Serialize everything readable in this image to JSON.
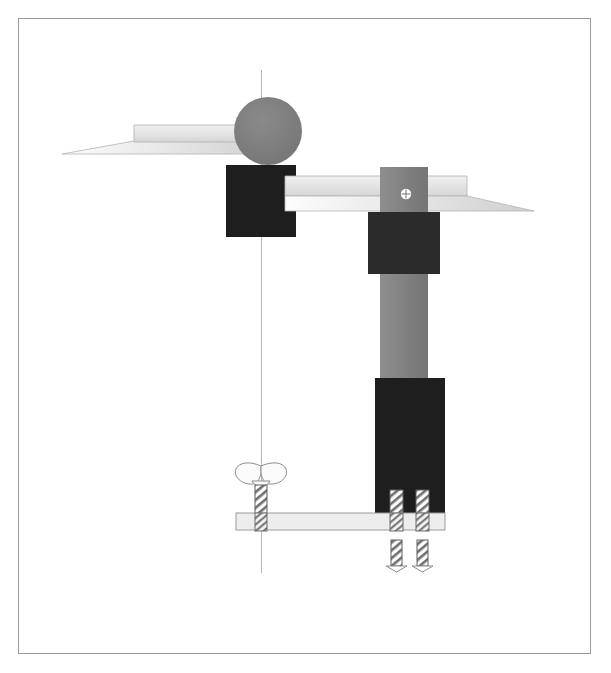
{
  "artwork": {
    "title": "Constructivist Tool Assembly",
    "background_color": "#ffffff",
    "frame": {
      "name": "border-frame",
      "x": 18,
      "y": 18,
      "width": 573,
      "height": 636,
      "stroke_color": "#9a9a9a",
      "stroke_width": 1
    },
    "palette": {
      "near_black": "#1e1e1e",
      "dark_charcoal": "#262626",
      "mid_gray": "#7c7c7c",
      "column_gray": "#858585",
      "light_gray": "#e2e2e2",
      "pale_gray": "#ececec",
      "blade_edge": "#b0b0b0",
      "hatch_gray": "#8a8a8a",
      "outline_gray": "#9a9a9a",
      "white": "#ffffff"
    },
    "axis_line": {
      "name": "vertical-axis-line",
      "x": 261,
      "y_top": 70,
      "y_bottom": 573,
      "color": "#b5b5b5",
      "width": 1
    },
    "shapes": [
      {
        "name": "left-blade-wedge",
        "type": "chisel-blade",
        "fill": "#e8e8e8",
        "stroke": "#a8a8a8",
        "points": "62,153 133,125 262,125 262,153",
        "tip_points": "62,153 133,142 262,142 262,153"
      },
      {
        "name": "left-dark-square",
        "type": "rect",
        "fill": "#1e1e1e",
        "x": 226,
        "y": 165,
        "width": 70,
        "height": 72
      },
      {
        "name": "gray-circle-head",
        "type": "circle",
        "fill": "#7c7c7c",
        "cx": 268,
        "cy": 131,
        "r": 34
      },
      {
        "name": "center-horizontal-blade",
        "type": "chisel-blade",
        "fill": "#e6e6e6",
        "stroke": "#a8a8a8",
        "x": 285,
        "y": 175,
        "width": 190,
        "height": 37
      },
      {
        "name": "right-blade-wedge",
        "type": "chisel-blade",
        "fill": "#e6e6e6",
        "stroke": "#a8a8a8",
        "points": "438,175 465,175 465,196 533,212 438,212"
      },
      {
        "name": "right-column",
        "type": "rect",
        "fill": "#858585",
        "x": 380,
        "y": 167,
        "width": 48,
        "height": 215
      },
      {
        "name": "upper-dark-block",
        "type": "rect",
        "fill": "#2b2b2b",
        "x": 368,
        "y": 212,
        "width": 72,
        "height": 62
      },
      {
        "name": "phillips-screw-head",
        "type": "screw-head",
        "fill": "#ffffff",
        "cx": 406,
        "cy": 194,
        "r": 5
      },
      {
        "name": "lower-dark-block",
        "type": "rect",
        "fill": "#1e1e1e",
        "x": 375,
        "y": 378,
        "width": 70,
        "height": 142
      },
      {
        "name": "base-plate",
        "type": "rect",
        "fill": "#ededed",
        "stroke": "#9a9a9a",
        "x": 236,
        "y": 513,
        "width": 209,
        "height": 17
      },
      {
        "name": "wing-nut",
        "type": "wing-nut",
        "fill": "#fafafa",
        "stroke": "#8a8a8a",
        "cx": 261,
        "cy": 477
      },
      {
        "name": "wing-nut-shaft",
        "type": "threaded-shaft",
        "x": 255,
        "y": 487,
        "width": 12,
        "height": 26
      },
      {
        "name": "screw-left",
        "type": "threaded-screw",
        "x": 390,
        "y": 490,
        "width": 13,
        "height": 40,
        "tip_y": 572
      },
      {
        "name": "screw-right",
        "type": "threaded-screw",
        "x": 416,
        "y": 490,
        "width": 13,
        "height": 40,
        "tip_y": 572
      }
    ]
  },
  "labels": {
    "none_visible": ""
  }
}
